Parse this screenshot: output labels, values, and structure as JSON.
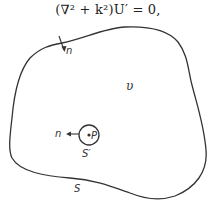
{
  "figure": {
    "equation": "(∇² + k²)U′ = 0,",
    "labels": {
      "outer_normal": "n",
      "volume": "υ",
      "inner_normal": "n",
      "point": "P",
      "inner_surface": "S′",
      "outer_surface": "S"
    },
    "colors": {
      "stroke": "#333333",
      "background": "#ffffff"
    }
  }
}
